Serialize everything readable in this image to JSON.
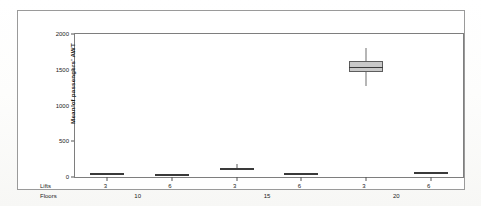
{
  "figure": {
    "y_axis_title": "Mean of passengers' AWT",
    "lifts_row_title": "Lifts",
    "floors_row_title": "Floors"
  },
  "chart_data": {
    "type": "box",
    "title": "",
    "xlabel": "",
    "ylabel": "Mean of passengers' AWT",
    "ylim": [
      0,
      2000
    ],
    "ytick_labels": [
      "0",
      "500",
      "1000",
      "1500",
      "2000"
    ],
    "ytick_values": [
      0,
      500,
      1000,
      1500,
      2000
    ],
    "grid": false,
    "legend": "none",
    "group_factors": [
      "Lifts",
      "Floors"
    ],
    "floors_groups": [
      {
        "label": "10",
        "lifts": [
          "3",
          "6"
        ]
      },
      {
        "label": "15",
        "lifts": [
          "3",
          "6"
        ]
      },
      {
        "label": "20",
        "lifts": [
          "3",
          "6"
        ]
      }
    ],
    "categories": [
      "Floors 10 / Lifts 3",
      "Floors 10 / Lifts 6",
      "Floors 15 / Lifts 3",
      "Floors 15 / Lifts 6",
      "Floors 20 / Lifts 3",
      "Floors 20 / Lifts 6"
    ],
    "boxes": [
      {
        "floors": "10",
        "lifts": "3",
        "whisker_low": 40,
        "q1": 45,
        "median": 50,
        "q3": 55,
        "whisker_high": 60
      },
      {
        "floors": "10",
        "lifts": "6",
        "whisker_low": 25,
        "q1": 28,
        "median": 32,
        "q3": 36,
        "whisker_high": 40
      },
      {
        "floors": "15",
        "lifts": "3",
        "whisker_low": 85,
        "q1": 95,
        "median": 105,
        "q3": 120,
        "whisker_high": 185
      },
      {
        "floors": "15",
        "lifts": "6",
        "whisker_low": 35,
        "q1": 40,
        "median": 45,
        "q3": 50,
        "whisker_high": 55
      },
      {
        "floors": "20",
        "lifts": "3",
        "whisker_low": 1270,
        "q1": 1470,
        "median": 1545,
        "q3": 1620,
        "whisker_high": 1810
      },
      {
        "floors": "20",
        "lifts": "6",
        "whisker_low": 55,
        "q1": 60,
        "median": 65,
        "q3": 70,
        "whisker_high": 75
      }
    ]
  }
}
